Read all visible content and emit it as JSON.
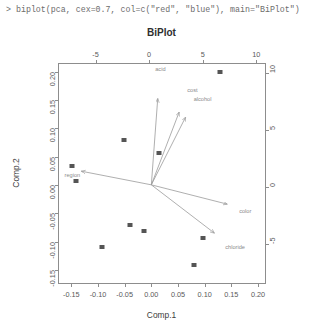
{
  "console": {
    "prompt": ">",
    "command": "biplot(pca, cex=0.7, col=c(\"red\", \"blue\"), main=\"BiPlot\")",
    "full_line": "> biplot(pca, cex=0.7, col=c(\"red\", \"blue\"), main=\"BiPlot\")"
  },
  "chart_data": {
    "type": "scatter",
    "title": "BiPlot",
    "xlabel": "Comp.1",
    "ylabel": "Comp.2",
    "xlim": [
      -0.175,
      0.215
    ],
    "ylim": [
      -0.175,
      0.215
    ],
    "x_ticks": [
      "-0.15",
      "-0.10",
      "-0.05",
      "0.00",
      "0.05",
      "0.10",
      "0.15",
      "0.20"
    ],
    "x_tick_values": [
      -0.15,
      -0.1,
      -0.05,
      0.0,
      0.05,
      0.1,
      0.15,
      0.2
    ],
    "y_ticks": [
      "-0.15",
      "-0.10",
      "-0.05",
      "0.00",
      "0.05",
      "0.10",
      "0.15",
      "0.20"
    ],
    "y_tick_values": [
      -0.15,
      -0.1,
      -0.05,
      0.0,
      0.05,
      0.1,
      0.15,
      0.2
    ],
    "top_axis_label": "",
    "top_ticks": [
      "-5",
      "0",
      "5",
      "10"
    ],
    "top_tick_values": [
      -5,
      0,
      5,
      10
    ],
    "right_ticks": [
      "-5",
      "0",
      "5",
      "10"
    ],
    "right_tick_values": [
      -5,
      0,
      5,
      10
    ],
    "secondary_xlim": [
      -8.5,
      10.9
    ],
    "secondary_ylim": [
      -8.5,
      10.9
    ],
    "grid": false,
    "legend": "none",
    "observation_color": "#555555",
    "loading_color": "#9a9a9a",
    "points": [
      {
        "x": -0.148,
        "y": 0.033
      },
      {
        "x": -0.142,
        "y": 0.006
      },
      {
        "x": -0.052,
        "y": 0.079
      },
      {
        "x": 0.015,
        "y": 0.057
      },
      {
        "x": 0.128,
        "y": 0.2
      },
      {
        "x": -0.04,
        "y": -0.071
      },
      {
        "x": -0.014,
        "y": -0.081
      },
      {
        "x": 0.097,
        "y": -0.093
      },
      {
        "x": 0.08,
        "y": -0.141
      },
      {
        "x": -0.093,
        "y": -0.11
      }
    ],
    "loadings": [
      {
        "label": "acid",
        "x": 0.012,
        "y": 0.152,
        "label_x": 0.017,
        "label_y": 0.205
      },
      {
        "label": "cost",
        "x": 0.052,
        "y": 0.128,
        "label_x": 0.077,
        "label_y": 0.168
      },
      {
        "label": "alcohol",
        "x": 0.064,
        "y": 0.119,
        "label_x": 0.096,
        "label_y": 0.151
      },
      {
        "label": "region",
        "x": -0.131,
        "y": 0.024,
        "label_x": -0.148,
        "label_y": 0.018
      },
      {
        "label": "color",
        "x": 0.142,
        "y": -0.034,
        "label_x": 0.176,
        "label_y": -0.047
      },
      {
        "label": "chloride",
        "x": 0.118,
        "y": -0.085,
        "label_x": 0.157,
        "label_y": -0.11
      }
    ]
  }
}
